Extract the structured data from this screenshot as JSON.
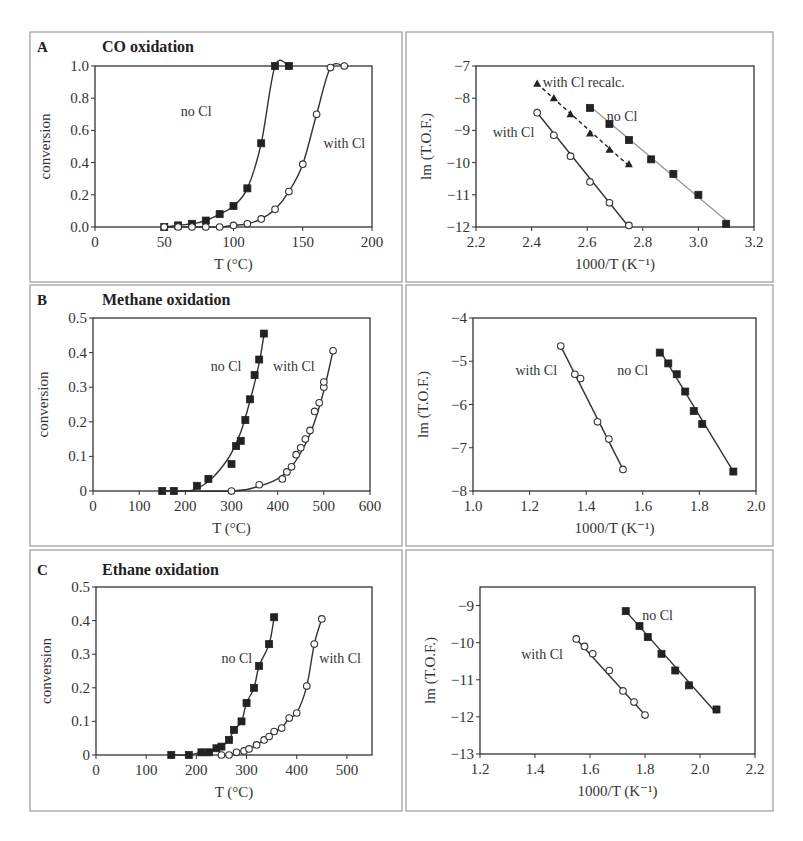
{
  "chart_data": [
    {
      "id": "A-left",
      "panel_letter": "A",
      "title": "CO oxidation",
      "type": "line",
      "xlabel": "T (°C)",
      "ylabel": "conversion",
      "xlim": [
        0,
        200
      ],
      "ylim": [
        0,
        1.0
      ],
      "xticks": [
        0,
        50,
        100,
        150,
        200
      ],
      "xtick_labels": [
        "0",
        "50",
        "100",
        "150",
        "200"
      ],
      "yticks": [
        0,
        0.2,
        0.4,
        0.6,
        0.8,
        1.0
      ],
      "ytick_labels": [
        "0.0",
        "0.2",
        "0.4",
        "0.6",
        "0.8",
        "1.0"
      ],
      "grid": false,
      "series": [
        {
          "name": "no Cl",
          "marker": "filled-square",
          "line": "solid",
          "x": [
            50,
            60,
            70,
            80,
            90,
            100,
            110,
            120,
            130,
            140
          ],
          "y": [
            0.0,
            0.01,
            0.02,
            0.04,
            0.08,
            0.13,
            0.24,
            0.52,
            1.0,
            1.0
          ],
          "label_pos": [
            62,
            0.72
          ]
        },
        {
          "name": "with Cl",
          "marker": "open-circle",
          "line": "solid",
          "x": [
            50,
            60,
            70,
            80,
            90,
            100,
            110,
            120,
            130,
            140,
            150,
            160,
            170,
            180
          ],
          "y": [
            0.0,
            0.0,
            0.0,
            0.0,
            0.0,
            0.01,
            0.02,
            0.05,
            0.11,
            0.22,
            0.39,
            0.7,
            0.99,
            1.0
          ],
          "label_pos": [
            165,
            0.52
          ]
        }
      ]
    },
    {
      "id": "A-right",
      "panel_letter": "",
      "title": "",
      "type": "scatter",
      "xlabel": "1000/T (K⁻¹)",
      "ylabel": "lm (T.O.F.)",
      "xlim": [
        2.2,
        3.2
      ],
      "ylim": [
        -12,
        -7
      ],
      "xticks": [
        2.2,
        2.4,
        2.6,
        2.8,
        3.0,
        3.2
      ],
      "xtick_labels": [
        "2.2",
        "2.4",
        "2.6",
        "2.8",
        "3.0",
        "3.2"
      ],
      "yticks": [
        -12,
        -11,
        -10,
        -9,
        -8,
        -7
      ],
      "ytick_labels": [
        "−12",
        "−11",
        "−10",
        "−9",
        "−8",
        "−7"
      ],
      "grid": false,
      "series": [
        {
          "name": "with Cl recalc.",
          "marker": "filled-triangle",
          "line": "dashed",
          "x": [
            2.42,
            2.48,
            2.54,
            2.61,
            2.68,
            2.75
          ],
          "y": [
            -7.55,
            -8.0,
            -8.5,
            -9.1,
            -9.6,
            -10.05
          ],
          "fit": [
            [
              2.42,
              -7.55
            ],
            [
              2.75,
              -10.1
            ]
          ],
          "label_pos": [
            2.44,
            -7.5
          ]
        },
        {
          "name": "no Cl",
          "marker": "filled-square",
          "line": "solid-gray",
          "x": [
            2.61,
            2.68,
            2.75,
            2.83,
            2.91,
            3.0,
            3.1
          ],
          "y": [
            -8.3,
            -8.8,
            -9.3,
            -9.9,
            -10.35,
            -11.0,
            -11.9
          ],
          "fit": [
            [
              2.61,
              -8.25
            ],
            [
              3.1,
              -11.8
            ]
          ],
          "label_pos": [
            2.67,
            -8.55
          ]
        },
        {
          "name": "with Cl",
          "marker": "open-circle",
          "line": "solid",
          "x": [
            2.42,
            2.48,
            2.54,
            2.61,
            2.68,
            2.75
          ],
          "y": [
            -8.45,
            -9.15,
            -9.8,
            -10.6,
            -11.25,
            -11.95
          ],
          "fit": [
            [
              2.42,
              -8.45
            ],
            [
              2.75,
              -12.0
            ]
          ],
          "label_pos": [
            2.26,
            -9.05
          ]
        }
      ]
    },
    {
      "id": "B-left",
      "panel_letter": "B",
      "title": "Methane oxidation",
      "type": "line",
      "xlabel": "T (°C)",
      "ylabel": "conversion",
      "xlim": [
        0,
        600
      ],
      "ylim": [
        0,
        0.5
      ],
      "xticks": [
        0,
        100,
        200,
        300,
        400,
        500,
        600
      ],
      "xtick_labels": [
        "0",
        "100",
        "200",
        "300",
        "400",
        "500",
        "600"
      ],
      "yticks": [
        0,
        0.1,
        0.2,
        0.3,
        0.4,
        0.5
      ],
      "ytick_labels": [
        "0",
        "0.1",
        "0.2",
        "0.3",
        "0.4",
        "0.5"
      ],
      "grid": false,
      "series": [
        {
          "name": "no Cl",
          "marker": "filled-square",
          "line": "solid",
          "x": [
            150,
            175,
            225,
            250,
            300,
            310,
            320,
            330,
            340,
            350,
            360,
            370
          ],
          "y": [
            0.0,
            0.0,
            0.015,
            0.035,
            0.078,
            0.13,
            0.145,
            0.205,
            0.265,
            0.335,
            0.38,
            0.455
          ],
          "curve_x": [
            150,
            200,
            220,
            240,
            260,
            280,
            300,
            320,
            340,
            360,
            370
          ],
          "curve_y": [
            0.0,
            0.0,
            0.004,
            0.018,
            0.04,
            0.07,
            0.11,
            0.17,
            0.26,
            0.37,
            0.45
          ],
          "label_pos": [
            255,
            0.36
          ]
        },
        {
          "name": "with Cl",
          "marker": "open-circle",
          "line": "solid",
          "x": [
            300,
            360,
            410,
            420,
            430,
            440,
            450,
            460,
            470,
            480,
            490,
            500,
            500,
            520
          ],
          "y": [
            0.0,
            0.018,
            0.035,
            0.055,
            0.07,
            0.105,
            0.125,
            0.15,
            0.175,
            0.23,
            0.255,
            0.3,
            0.315,
            0.405
          ],
          "curve_x": [
            150,
            300,
            350,
            400,
            430,
            460,
            480,
            500,
            520
          ],
          "curve_y": [
            0.0,
            0.0,
            0.01,
            0.035,
            0.07,
            0.135,
            0.2,
            0.29,
            0.405
          ],
          "label_pos": [
            390,
            0.36
          ]
        }
      ]
    },
    {
      "id": "B-right",
      "panel_letter": "",
      "title": "",
      "type": "scatter",
      "xlabel": "1000/T (K⁻¹)",
      "ylabel": "lm (T.O.F.)",
      "xlim": [
        1.0,
        2.0
      ],
      "ylim": [
        -8,
        -4
      ],
      "xticks": [
        1.0,
        1.2,
        1.4,
        1.6,
        1.8,
        2.0
      ],
      "xtick_labels": [
        "1.0",
        "1.2",
        "1.4",
        "1.6",
        "1.8",
        "2.0"
      ],
      "yticks": [
        -8,
        -7,
        -6,
        -5,
        -4
      ],
      "ytick_labels": [
        "−8",
        "−7",
        "−6",
        "−5",
        "−4"
      ],
      "grid": false,
      "series": [
        {
          "name": "with Cl",
          "marker": "open-circle",
          "line": "solid",
          "x": [
            1.31,
            1.36,
            1.38,
            1.44,
            1.48,
            1.53
          ],
          "y": [
            -4.65,
            -5.3,
            -5.4,
            -6.4,
            -6.8,
            -7.5
          ],
          "fit": [
            [
              1.31,
              -4.65
            ],
            [
              1.53,
              -7.5
            ]
          ],
          "label_pos": [
            1.15,
            -5.2
          ]
        },
        {
          "name": "no Cl",
          "marker": "filled-square",
          "line": "solid",
          "x": [
            1.66,
            1.69,
            1.72,
            1.75,
            1.78,
            1.81,
            1.92
          ],
          "y": [
            -4.8,
            -5.05,
            -5.3,
            -5.7,
            -6.15,
            -6.45,
            -7.55
          ],
          "fit": [
            [
              1.66,
              -4.75
            ],
            [
              1.92,
              -7.55
            ]
          ],
          "label_pos": [
            1.51,
            -5.2
          ]
        }
      ]
    },
    {
      "id": "C-left",
      "panel_letter": "C",
      "title": "Ethane oxidation",
      "type": "line",
      "xlabel": "T (°C)",
      "ylabel": "conversion",
      "xlim": [
        0,
        550
      ],
      "ylim": [
        0,
        0.5
      ],
      "xticks": [
        0,
        100,
        200,
        300,
        400,
        500
      ],
      "xtick_labels": [
        "0",
        "100",
        "200",
        "300",
        "400",
        "500"
      ],
      "yticks": [
        0,
        0.1,
        0.2,
        0.3,
        0.4,
        0.5
      ],
      "ytick_labels": [
        "0",
        "0.1",
        "0.2",
        "0.3",
        "0.4",
        "0.5"
      ],
      "grid": false,
      "series": [
        {
          "name": "no Cl",
          "marker": "filled-square",
          "line": "solid",
          "x": [
            150,
            185,
            210,
            225,
            240,
            250,
            265,
            275,
            290,
            300,
            315,
            325,
            345,
            355
          ],
          "y": [
            0.0,
            0.0,
            0.008,
            0.008,
            0.02,
            0.025,
            0.045,
            0.075,
            0.1,
            0.155,
            0.2,
            0.265,
            0.33,
            0.41
          ],
          "label_pos": [
            250,
            0.29
          ]
        },
        {
          "name": "with Cl",
          "marker": "open-circle",
          "line": "solid",
          "x": [
            250,
            265,
            280,
            295,
            305,
            320,
            335,
            345,
            355,
            370,
            385,
            400,
            420,
            435,
            450
          ],
          "y": [
            0.0,
            0.0,
            0.008,
            0.012,
            0.018,
            0.03,
            0.045,
            0.055,
            0.07,
            0.08,
            0.11,
            0.125,
            0.205,
            0.33,
            0.405
          ],
          "label_pos": [
            445,
            0.29
          ]
        }
      ]
    },
    {
      "id": "C-right",
      "panel_letter": "",
      "title": "",
      "type": "scatter",
      "xlabel": "1000/T (K⁻¹)",
      "ylabel": "lm (T.O.F.)",
      "xlim": [
        1.2,
        2.2
      ],
      "ylim": [
        -13,
        -8.5
      ],
      "xticks": [
        1.2,
        1.4,
        1.6,
        1.8,
        2.0,
        2.2
      ],
      "xtick_labels": [
        "1.2",
        "1.4",
        "1.6",
        "1.8",
        "2.0",
        "2.2"
      ],
      "yticks": [
        -13,
        -12,
        -11,
        -10,
        -9
      ],
      "ytick_labels": [
        "−13",
        "−12",
        "−11",
        "−10",
        "−9"
      ],
      "grid": false,
      "series": [
        {
          "name": "with Cl",
          "marker": "open-circle",
          "line": "solid",
          "x": [
            1.55,
            1.58,
            1.61,
            1.67,
            1.72,
            1.76,
            1.8
          ],
          "y": [
            -9.9,
            -10.1,
            -10.3,
            -10.75,
            -11.3,
            -11.6,
            -11.95
          ],
          "fit": [
            [
              1.55,
              -9.9
            ],
            [
              1.8,
              -11.95
            ]
          ],
          "label_pos": [
            1.35,
            -10.3
          ]
        },
        {
          "name": "no Cl",
          "marker": "filled-square",
          "line": "solid",
          "x": [
            1.73,
            1.78,
            1.81,
            1.86,
            1.91,
            1.96,
            2.06
          ],
          "y": [
            -9.15,
            -9.55,
            -9.85,
            -10.3,
            -10.75,
            -11.15,
            -11.8
          ],
          "fit": [
            [
              1.73,
              -9.15
            ],
            [
              2.06,
              -11.9
            ]
          ],
          "label_pos": [
            1.79,
            -9.25
          ]
        }
      ]
    }
  ]
}
